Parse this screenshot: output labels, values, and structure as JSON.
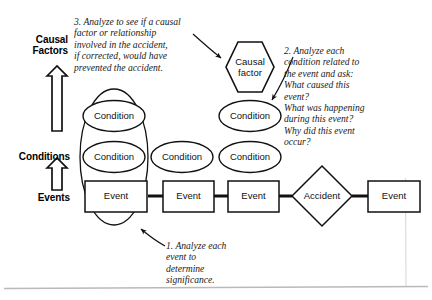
{
  "diagram": {
    "axis_labels": [
      {
        "id": "causal-factors",
        "text": "Causal\nFactors"
      },
      {
        "id": "conditions",
        "text": "Conditions"
      },
      {
        "id": "events",
        "text": "Events"
      }
    ],
    "nodes": [
      {
        "id": "causal-factor-1",
        "shape": "hexagon",
        "label": "Causal\nfactor"
      },
      {
        "id": "condition-top-left",
        "shape": "ellipse",
        "label": "Condition"
      },
      {
        "id": "condition-top-right",
        "shape": "ellipse",
        "label": "Condition"
      },
      {
        "id": "condition-row-1",
        "shape": "ellipse",
        "label": "Condition"
      },
      {
        "id": "condition-row-2",
        "shape": "ellipse",
        "label": "Condition"
      },
      {
        "id": "condition-row-3",
        "shape": "ellipse",
        "label": "Condition"
      },
      {
        "id": "event-1",
        "shape": "rectangle",
        "label": "Event"
      },
      {
        "id": "event-2",
        "shape": "rectangle",
        "label": "Event"
      },
      {
        "id": "event-3",
        "shape": "rectangle",
        "label": "Event"
      },
      {
        "id": "accident",
        "shape": "diamond",
        "label": "Accident"
      },
      {
        "id": "event-4",
        "shape": "rectangle",
        "label": "Event"
      }
    ],
    "notes": [
      {
        "id": "note-3",
        "number": "3.",
        "text": "3. Analyze to see if a causal\n    factor or relationship\n    involved in the accident,\n    if corrected, would have\n    prevented the accident."
      },
      {
        "id": "note-2",
        "number": "2.",
        "text": "2. Analyze each\n    condition related to\n    the event and ask:\n    What caused this\n    event?\n    What was happening\n    during this event?\n    Why did this event\n    occur?"
      },
      {
        "id": "note-1",
        "number": "1.",
        "text": "1. Analyze each\n    event to\n    determine\n    significance."
      }
    ],
    "colors": {
      "stroke": "#111111",
      "background": "#ffffff",
      "text": "#111111",
      "frame_rule": "#b9b9b9"
    }
  }
}
